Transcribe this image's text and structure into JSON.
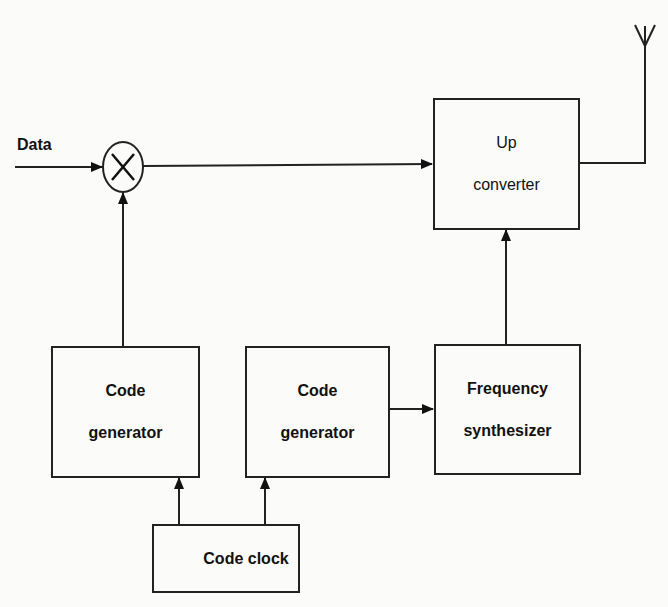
{
  "diagram": {
    "type": "block-diagram",
    "input_label": "Data",
    "mixer": {
      "symbol": "multiply",
      "label": "×"
    },
    "blocks": [
      {
        "id": "upconverter",
        "line1": "Up",
        "line2": "converter"
      },
      {
        "id": "code_gen_1",
        "line1": "Code",
        "line2": "generator"
      },
      {
        "id": "code_gen_2",
        "line1": "Code",
        "line2": "generator"
      },
      {
        "id": "freq_synth",
        "line1": "Frequency",
        "line2": "synthesizer"
      },
      {
        "id": "code_clock",
        "line1": "Code clock",
        "line2": ""
      }
    ],
    "connections": [
      {
        "from": "Data",
        "to": "mixer"
      },
      {
        "from": "code_gen_1",
        "to": "mixer"
      },
      {
        "from": "mixer",
        "to": "upconverter"
      },
      {
        "from": "freq_synth",
        "to": "upconverter"
      },
      {
        "from": "upconverter",
        "to": "antenna"
      },
      {
        "from": "code_clock",
        "to": "code_gen_1"
      },
      {
        "from": "code_clock",
        "to": "code_gen_2"
      },
      {
        "from": "code_gen_2",
        "to": "freq_synth"
      }
    ],
    "output": "antenna"
  }
}
